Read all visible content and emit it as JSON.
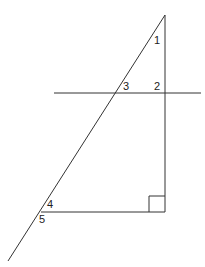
{
  "diagram": {
    "line_color": "#333333",
    "angle_labels": [
      {
        "id": "1",
        "text": "1",
        "x": 154,
        "y": 44
      },
      {
        "id": "2",
        "text": "2",
        "x": 154,
        "y": 90
      },
      {
        "id": "3",
        "text": "3",
        "x": 123,
        "y": 90
      },
      {
        "id": "4",
        "text": "4",
        "x": 47,
        "y": 208
      },
      {
        "id": "5",
        "text": "5",
        "x": 39,
        "y": 223
      }
    ],
    "right_angle_marker": true
  }
}
